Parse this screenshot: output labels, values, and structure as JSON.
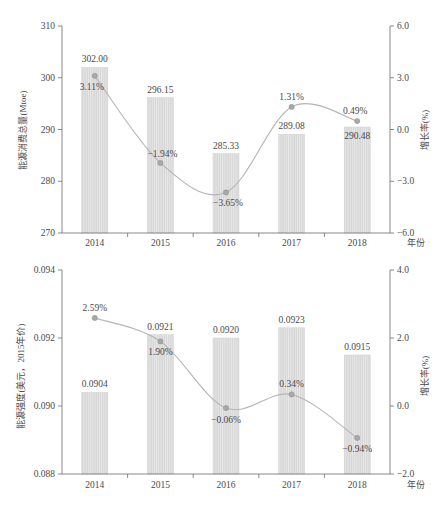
{
  "chart_data": [
    {
      "id": "energy-consumption",
      "type": "bar",
      "title": "",
      "xlabel": "年份",
      "ylabel": "能源消费总量(Mtoe)",
      "y2label": "增长率(%)",
      "categories": [
        "2014",
        "2015",
        "2016",
        "2017",
        "2018"
      ],
      "values": [
        302.0,
        296.15,
        285.33,
        289.08,
        290.48
      ],
      "value_labels": [
        "302.00",
        "296.15",
        "285.33",
        "289.08",
        "290.48"
      ],
      "ylim": [
        270,
        310
      ],
      "yticks": [
        270,
        280,
        290,
        300,
        310
      ],
      "ytick_labels": [
        "270",
        "280",
        "290",
        "300",
        "310"
      ],
      "ylim2": [
        -6.0,
        6.0
      ],
      "yticks2": [
        -6.0,
        -3.0,
        0.0,
        3.0,
        6.0
      ],
      "ytick_labels2": [
        "-6.0",
        "-3.0",
        "0.0",
        "3.0",
        "6.0"
      ],
      "series": [
        {
          "name": "增长率",
          "axis": "right",
          "values": [
            3.11,
            -1.94,
            -3.65,
            1.31,
            0.49
          ],
          "labels": [
            "3.11%",
            "-1.94%",
            "-3.65%",
            "1.31%",
            "0.49%"
          ]
        }
      ],
      "grid": false,
      "legend": "none"
    },
    {
      "id": "energy-intensity",
      "type": "bar",
      "title": "",
      "xlabel": "年份",
      "ylabel": "能源强度(美元，2015年价)",
      "y2label": "增长率(%)",
      "categories": [
        "2014",
        "2015",
        "2016",
        "2017",
        "2018"
      ],
      "values": [
        0.0904,
        0.0921,
        0.092,
        0.0923,
        0.0915
      ],
      "value_labels": [
        "0.0904",
        "0.0921",
        "0.0920",
        "0.0923",
        "0.0915"
      ],
      "ylim": [
        0.088,
        0.094
      ],
      "yticks": [
        0.088,
        0.09,
        0.092,
        0.094
      ],
      "ytick_labels": [
        "0.088",
        "0.090",
        "0.092",
        "0.094"
      ],
      "ylim2": [
        -2.0,
        4.0
      ],
      "yticks2": [
        -2.0,
        0.0,
        2.0,
        4.0
      ],
      "ytick_labels2": [
        "-2.0",
        "0.0",
        "2.0",
        "4.0"
      ],
      "series": [
        {
          "name": "增长率",
          "axis": "right",
          "values": [
            2.59,
            1.9,
            -0.06,
            0.34,
            -0.94
          ],
          "labels": [
            "2.59%",
            "1.90%",
            "-0.06%",
            "0.34%",
            "-0.94%"
          ]
        }
      ],
      "grid": false,
      "legend": "none"
    }
  ],
  "colors": {
    "bar_fill": "#d6d6d6",
    "bar_stripe": "#e9e9e9",
    "line": "#b4b4b4",
    "marker": "#a8a8a8",
    "axis": "#7c7c7c",
    "text": "#4a4a4a",
    "background": "#ffffff"
  }
}
